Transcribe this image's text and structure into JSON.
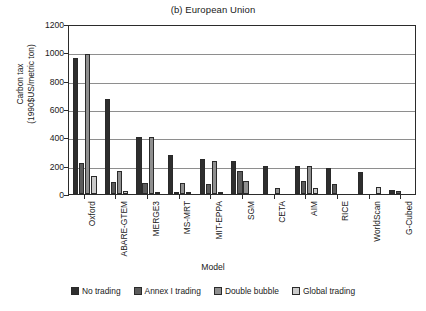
{
  "chart_data": {
    "type": "bar",
    "title": "(b) European Union",
    "xlabel": "Model",
    "ylabel_line1": "Carbon tax",
    "ylabel_line2": "(1990$US/metric ton)",
    "ylim": [
      0,
      1200
    ],
    "yticks": [
      0,
      200,
      400,
      600,
      800,
      1000,
      1200
    ],
    "ytick_labels": [
      "0",
      "200",
      "400",
      "600",
      "800",
      "1000",
      "1200"
    ],
    "grid": true,
    "legend_position": "bottom",
    "categories": [
      "Oxford",
      "ABARE-GTEM",
      "MERGE3",
      "MS-MRT",
      "MIT-EPPA",
      "SGM",
      "CETA",
      "AIM",
      "RICE",
      "WorldScan",
      "G-Cubed"
    ],
    "series": [
      {
        "name": "No trading",
        "color": "#2e2e2e",
        "values": [
          960,
          670,
          405,
          275,
          245,
          235,
          195,
          195,
          185,
          155,
          25
        ]
      },
      {
        "name": "Annex I trading",
        "color": "#5b5b5b",
        "values": [
          220,
          85,
          80,
          10,
          70,
          160,
          0,
          90,
          70,
          0,
          20
        ]
      },
      {
        "name": "Double bubble",
        "color": "#8f8f8f",
        "values": [
          985,
          165,
          405,
          80,
          235,
          90,
          45,
          195,
          0,
          0,
          0
        ]
      },
      {
        "name": "Global trading",
        "color": "#cbcbcb",
        "values": [
          130,
          20,
          15,
          8,
          15,
          0,
          0,
          40,
          0,
          50,
          0
        ]
      }
    ]
  }
}
